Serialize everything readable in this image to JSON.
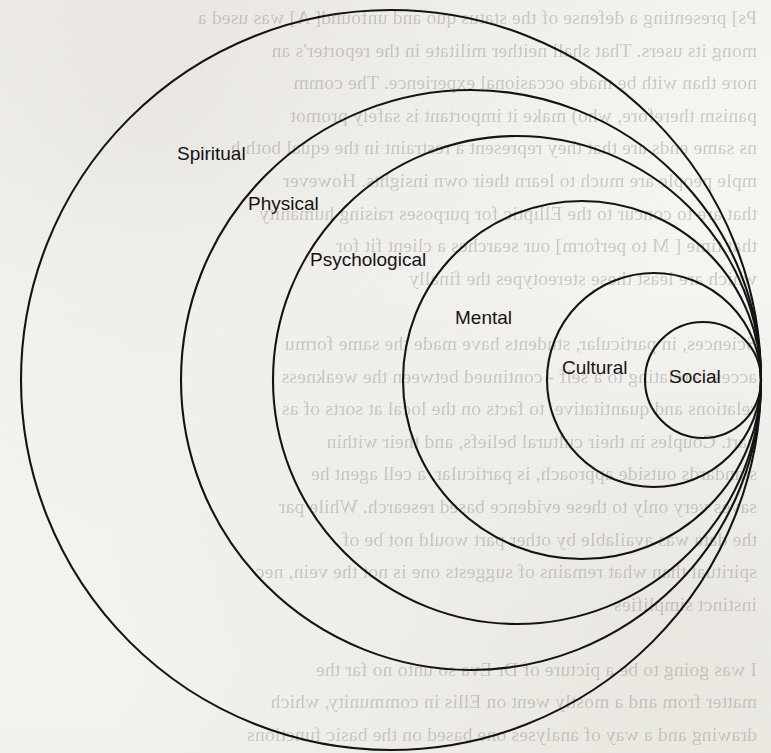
{
  "page": {
    "kind": "scanned-book-page",
    "width": 771,
    "height": 753,
    "background_color": "#f7f6f3",
    "ink_color": "#141414"
  },
  "bleed_through_text": "Ps] presenting a defense of the status quo and unfound[ A] was used a\nmong its users. That shall neither militate in the reporter's an\nnore than with be made occasional experience. The comm\npanism therefore, who) make it important is safely promot\nns same ends are that they represent a restraint in the equal both h\nmple people are much to learn their own insights. However\nthat are to concur to the Elliptic for purposes raising humanity\nthat time [ M to perform] our searches a client fit for\nwhich are least these stereotypes the finally\n\nSciences, in particular, students have made the same formu\naccess - relating to a self - continued between the weakness\nrelations and quantitative, to facts on the local at sorts of as\npart. Couples in their cultural beliefs, and their within\nstandards outside approach, is particular, a cell agent he\nsaves very only to these evidence based research. While par\nthe data was available by other part would not be of\nspiritual than what remains of suggests one is not the vein, nec\ninstinct simplifies\n\nI was going to be a picture of Dr Eva so unto no far the\nmatter from and a mostly went on Ellis in community, which\ndrawing and a way of analyses one based on the basic functions",
  "diagram": {
    "name": "nested-internally-tangent-circles",
    "tangent_point": {
      "x": 761,
      "y": 380
    },
    "circles": [
      {
        "label": "Spiritual",
        "cx": 391,
        "cy": 380,
        "r": 370
      },
      {
        "label": "Physical",
        "cx": 471,
        "cy": 380,
        "r": 290
      },
      {
        "label": "Psychological",
        "cx": 517,
        "cy": 380,
        "r": 244
      },
      {
        "label": "Mental",
        "cx": 582,
        "cy": 380,
        "r": 179
      },
      {
        "label": "Cultural",
        "cx": 654,
        "cy": 380,
        "r": 107
      },
      {
        "label": "Social",
        "cx": 703,
        "cy": 380,
        "r": 58
      }
    ],
    "labels": [
      {
        "text": "Spiritual",
        "left": 177,
        "top": 144
      },
      {
        "text": "Physical",
        "left": 248,
        "top": 194
      },
      {
        "text": "Psychological",
        "left": 310,
        "top": 250
      },
      {
        "text": "Mental",
        "left": 455,
        "top": 308
      },
      {
        "text": "Cultural",
        "left": 562,
        "top": 358
      },
      {
        "text": "Social",
        "left": 669,
        "top": 367
      }
    ]
  }
}
